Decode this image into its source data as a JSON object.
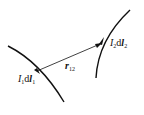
{
  "diagram": {
    "element1": {
      "current": "I",
      "index": "1",
      "d": "d",
      "vec": "l",
      "vec_index": "1"
    },
    "element2": {
      "current": "I",
      "index": "2",
      "d": "d",
      "vec": "l",
      "vec_index": "2"
    },
    "separation": {
      "vec": "r",
      "index": "12"
    },
    "colors": {
      "stroke": "#111111",
      "background": "#ffffff"
    }
  }
}
